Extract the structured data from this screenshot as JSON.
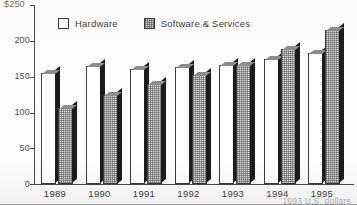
{
  "chart_data": {
    "type": "bar",
    "title": "",
    "subtitle": "",
    "xlabel": "",
    "ylabel": "",
    "top_axis_label": "$250",
    "ylim": [
      0,
      250
    ],
    "yticks": [
      0,
      50,
      100,
      150,
      200,
      250
    ],
    "ytick_labels": [
      "0",
      "50",
      "100",
      "150",
      "200",
      "$250"
    ],
    "grid": false,
    "legend_position": "top-center",
    "categories": [
      "1989",
      "1990",
      "1991",
      "1992",
      "1993",
      "1994",
      "1995"
    ],
    "series": [
      {
        "name": "Hardware",
        "swatch": "white",
        "values": [
          155,
          165,
          161,
          164,
          166,
          175,
          183
        ]
      },
      {
        "name": "Software & Services",
        "swatch": "gray-dotted",
        "values": [
          106,
          125,
          139,
          152,
          166,
          189,
          215
        ]
      }
    ],
    "annotations": {
      "footnote": "1993 U.S. dollars"
    }
  },
  "legend": {
    "entries": [
      {
        "label": "Hardware"
      },
      {
        "label": "Software & Services"
      }
    ]
  },
  "axis": {
    "top_label": "$250",
    "tick_labels": [
      "200",
      "150",
      "100",
      "50",
      "0"
    ],
    "year_labels": [
      "1989",
      "1990",
      "1991",
      "1992",
      "1993",
      "1994",
      "1995"
    ]
  },
  "footnote": {
    "text": "1993 U.S. dollars"
  },
  "colors": {
    "hardware_fill": "#ffffff",
    "software_fill": "#d9d9d9",
    "bar_outline": "#3b3b3b",
    "bar_shadow": "#1c1c1c",
    "axis": "#4a4a4a",
    "text": "#3f3f3f",
    "background": "#fdfdfd"
  }
}
